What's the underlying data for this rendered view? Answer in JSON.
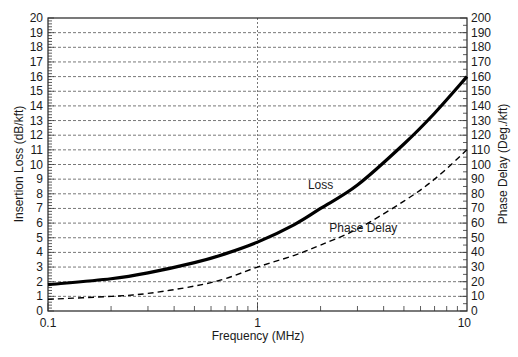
{
  "chart_data": {
    "type": "line",
    "title": "",
    "xlabel": "Frequency (MHz)",
    "ylabel": "Insertion Loss (dB/kft)",
    "y2label": "Phase Delay (Deg./kft)",
    "xscale": "log",
    "xlim": [
      0.1,
      10
    ],
    "ylim": [
      0,
      20
    ],
    "y2lim": [
      0,
      200
    ],
    "x_ticks": [
      "0.1",
      "1",
      "10"
    ],
    "y_ticks": [
      "0",
      "1",
      "2",
      "3",
      "4",
      "5",
      "6",
      "7",
      "8",
      "9",
      "10",
      "11",
      "12",
      "13",
      "14",
      "15",
      "16",
      "17",
      "18",
      "19",
      "20"
    ],
    "y2_ticks": [
      "0",
      "10",
      "20",
      "30",
      "40",
      "50",
      "60",
      "70",
      "80",
      "90",
      "100",
      "110",
      "120",
      "130",
      "140",
      "150",
      "160",
      "170",
      "180",
      "190",
      "200"
    ],
    "grid": {
      "horizontal": "dashed",
      "vertical_at": [
        1
      ]
    },
    "legend": "inline annotations",
    "annotations": [
      {
        "text": "Loss",
        "x": 2.0,
        "y": 8.3
      },
      {
        "text": "Phase Delay",
        "x": 3.2,
        "y": 5.4
      }
    ],
    "series": [
      {
        "name": "Loss",
        "axis": "left",
        "style": "solid-thick",
        "color": "#000000",
        "x": [
          0.1,
          0.2,
          0.3,
          0.5,
          0.7,
          1.0,
          1.5,
          2.0,
          3.0,
          5.0,
          7.0,
          10.0
        ],
        "values": [
          1.8,
          2.2,
          2.6,
          3.3,
          3.9,
          4.7,
          5.9,
          7.0,
          8.6,
          11.4,
          13.5,
          16.0
        ]
      },
      {
        "name": "Phase Delay",
        "axis": "right",
        "style": "dashed",
        "color": "#000000",
        "x": [
          0.1,
          0.2,
          0.3,
          0.5,
          0.7,
          1.0,
          1.5,
          2.0,
          3.0,
          5.0,
          7.0,
          10.0
        ],
        "values": [
          8,
          10,
          12,
          17,
          22,
          30,
          38,
          45,
          56,
          75,
          90,
          110
        ]
      }
    ]
  }
}
